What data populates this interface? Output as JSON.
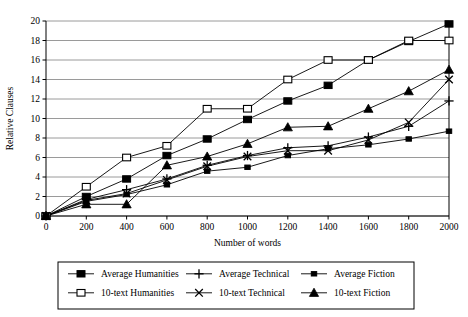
{
  "chart_data": {
    "type": "line",
    "title": "",
    "subtitle": "",
    "xlabel": "Number of words",
    "ylabel": "Relative Clauses",
    "x": [
      0,
      200,
      400,
      600,
      800,
      1000,
      1200,
      1400,
      1600,
      1800,
      2000
    ],
    "xlim": [
      0,
      2000
    ],
    "ylim": [
      0,
      20
    ],
    "xticks": [
      0,
      200,
      400,
      600,
      800,
      1000,
      1200,
      1400,
      1600,
      1800,
      2000
    ],
    "yticks": [
      0,
      2,
      4,
      6,
      8,
      10,
      12,
      14,
      16,
      18,
      20
    ],
    "grid": "horizontal",
    "legend_position": "bottom",
    "series": [
      {
        "name": "Average Humanities",
        "marker": "filled-square",
        "values": [
          0,
          2.0,
          3.8,
          6.2,
          7.9,
          9.9,
          11.8,
          13.4,
          16.0,
          17.9,
          19.7
        ]
      },
      {
        "name": "10-text Humanities",
        "marker": "open-square",
        "values": [
          0,
          3.0,
          6.0,
          7.2,
          11.0,
          11.0,
          14.0,
          16.0,
          16.0,
          18.0,
          18.0
        ]
      },
      {
        "name": "Average Technical",
        "marker": "plus",
        "values": [
          0,
          1.7,
          2.7,
          3.8,
          5.2,
          6.2,
          7.0,
          7.2,
          8.1,
          9.2,
          11.8
        ]
      },
      {
        "name": "10-text Technical",
        "marker": "cross",
        "values": [
          0,
          1.6,
          2.3,
          3.7,
          5.1,
          6.1,
          6.7,
          6.7,
          7.8,
          9.6,
          14.0
        ]
      },
      {
        "name": "Average Fiction",
        "marker": "small-filled-square",
        "values": [
          0,
          1.5,
          2.2,
          3.2,
          4.6,
          5.0,
          6.2,
          6.9,
          7.3,
          7.9,
          8.7
        ]
      },
      {
        "name": "10-text Fiction",
        "marker": "filled-triangle",
        "values": [
          0,
          1.2,
          1.2,
          5.2,
          6.1,
          7.4,
          9.1,
          9.2,
          11.0,
          12.8,
          15.0
        ]
      }
    ]
  },
  "axes": {
    "ylabel": "Relative Clauses",
    "xlabel": "Number of words",
    "xticks": [
      "0",
      "200",
      "400",
      "600",
      "800",
      "1000",
      "1200",
      "1400",
      "1600",
      "1800",
      "2000"
    ],
    "yticks": [
      "0",
      "2",
      "4",
      "6",
      "8",
      "10",
      "12",
      "14",
      "16",
      "18",
      "20"
    ]
  },
  "legend": {
    "entries": [
      {
        "label": "Average Humanities",
        "marker": "filled-square"
      },
      {
        "label": "Average Technical",
        "marker": "plus"
      },
      {
        "label": "Average Fiction",
        "marker": "small-filled-square"
      },
      {
        "label": "10-text Humanities",
        "marker": "open-square"
      },
      {
        "label": "10-text Technical",
        "marker": "cross"
      },
      {
        "label": "10-text Fiction",
        "marker": "filled-triangle"
      }
    ]
  },
  "colors": {
    "line": "#000000",
    "grid": "#808080",
    "axis": "#000000",
    "background": "#ffffff"
  }
}
